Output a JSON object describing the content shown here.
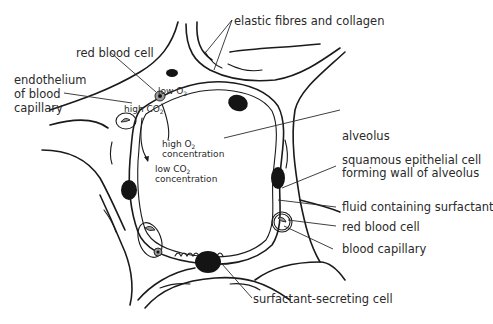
{
  "diagram": {
    "type": "labelled-biology-diagram",
    "top_caption_fragment": "",
    "labels": {
      "elastic_fibres": "elastic fibres and collagen",
      "red_blood_cell_top": "red blood cell",
      "endothelium_line1": "endothelium",
      "endothelium_line2": "of blood",
      "endothelium_line3": "capillary",
      "low_o2": "low O",
      "high_co2": "high CO",
      "high_o2_line1": "high O",
      "high_o2_line2": "concentration",
      "low_co2_line1": "low CO",
      "low_co2_line2": "concentration",
      "subscript_2": "2",
      "alveolus": "alveolus",
      "squamous_line1": "squamous epithelial cell",
      "squamous_line2": "forming wall of alveolus",
      "fluid": "fluid containing surfactant",
      "red_blood_cell_right": "red blood cell",
      "blood_capillary": "blood capillary",
      "surfactant_cell": "surfactant-secreting cell"
    },
    "colors": {
      "ink": "#1a1a1a",
      "text": "#2a2a2a",
      "rbc_fill": "#9a9a9a",
      "background": "#ffffff"
    }
  }
}
